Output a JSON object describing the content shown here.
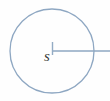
{
  "figure": {
    "type": "geometry-diagram",
    "background_color": "#fefefe",
    "canvas": {
      "width": 110,
      "height": 101
    },
    "stroke_color": "#8ea7c2",
    "label_color": "#3b3b3b",
    "circle": {
      "name": "circle-outline",
      "center_x": 52,
      "center_y": 51,
      "radius": 42,
      "stroke_width": 1.3,
      "fill": "none"
    },
    "radius_line": {
      "name": "radius-line",
      "x1": 52,
      "y1": 51,
      "x2": 110,
      "y2": 51,
      "stroke_width": 1.6
    },
    "center_tick": {
      "name": "center-tick-mark",
      "x1": 52.5,
      "y1": 42,
      "x2": 52.5,
      "y2": 55,
      "stroke_width": 1.4
    },
    "center_label": {
      "name": "center-point-label",
      "text": "s",
      "x": 44,
      "y": 56,
      "font_size": 15
    }
  }
}
